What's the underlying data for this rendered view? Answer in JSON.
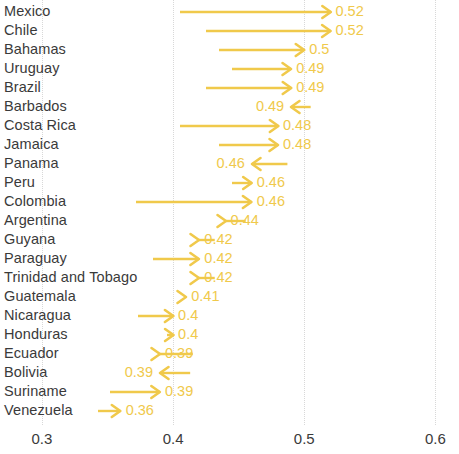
{
  "chart_data": {
    "type": "bar",
    "subtype": "arrow-change-plot",
    "title": "",
    "xlabel": "",
    "ylabel": "",
    "xlim": [
      0.268,
      0.618
    ],
    "xticks": [
      0.3,
      0.4,
      0.5,
      0.6
    ],
    "xtick_labels": [
      "0.3",
      "0.4",
      "0.5",
      "0.6"
    ],
    "grid": true,
    "legend": "none",
    "orientation": "horizontal",
    "accent_color": "#f0c94b",
    "label_color": "#3a3a3a",
    "gridline_color": "#d8d8d8",
    "categories": [
      "Mexico",
      "Chile",
      "Bahamas",
      "Uruguay",
      "Brazil",
      "Barbados",
      "Costa Rica",
      "Jamaica",
      "Panama",
      "Peru",
      "Colombia",
      "Argentina",
      "Guyana",
      "Paraguay",
      "Trinidad and Tobago",
      "Guatemala",
      "Nicaragua",
      "Honduras",
      "Ecuador",
      "Bolivia",
      "Suriname",
      "Venezuela"
    ],
    "series": [
      {
        "name": "start",
        "values": [
          0.405,
          0.425,
          0.435,
          0.445,
          0.425,
          0.505,
          0.405,
          0.435,
          0.487,
          0.445,
          0.372,
          0.455,
          0.432,
          0.385,
          0.432,
          0.41,
          0.373,
          0.395,
          0.415,
          0.413,
          0.352,
          0.343
        ]
      },
      {
        "name": "end",
        "values": [
          0.52,
          0.52,
          0.5,
          0.49,
          0.49,
          0.49,
          0.48,
          0.48,
          0.46,
          0.46,
          0.46,
          0.44,
          0.42,
          0.42,
          0.42,
          0.41,
          0.4,
          0.4,
          0.39,
          0.39,
          0.39,
          0.36
        ]
      }
    ],
    "value_labels": [
      "0.52",
      "0.52",
      "0.5",
      "0.49",
      "0.49",
      "0.49",
      "0.48",
      "0.48",
      "0.46",
      "0.46",
      "0.46",
      "0.44",
      "0.42",
      "0.42",
      "0.42",
      "0.41",
      "0.4",
      "0.4",
      "0.39",
      "0.39",
      "0.39",
      "0.36"
    ],
    "directions": [
      "right",
      "right",
      "right",
      "right",
      "right",
      "left",
      "right",
      "right",
      "left",
      "right",
      "right",
      "right",
      "right",
      "right",
      "right",
      "right",
      "right",
      "right",
      "right",
      "left",
      "right",
      "right"
    ]
  }
}
